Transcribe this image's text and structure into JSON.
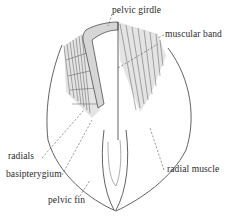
{
  "figure": {
    "labels": {
      "pelvic_girdle": "pelvic girdle",
      "muscular_band": "muscular band",
      "radials": "radials",
      "basipterygium": "basipterygium",
      "pelvic_fin": "pelvic fin",
      "radial_muscle": "radial muscle"
    },
    "colors": {
      "line": "#3a3a3a",
      "shading": "#d6d6d6",
      "text": "#2a2a2a",
      "background": "#ffffff"
    }
  }
}
